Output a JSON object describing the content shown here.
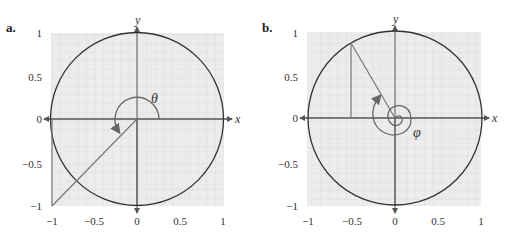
{
  "panels": [
    {
      "label": "a.",
      "axis_x": "x",
      "axis_y": "y",
      "angle_symbol": "θ",
      "x_ticks": [
        "−1",
        "−0.5",
        "0",
        "0.5",
        "1"
      ],
      "y_ticks": [
        "1",
        "0.5",
        "0",
        "−0.5",
        "−1"
      ],
      "point": {
        "x": -1,
        "y": -1
      }
    },
    {
      "label": "b.",
      "axis_x": "x",
      "axis_y": "y",
      "angle_symbol": "φ",
      "x_ticks": [
        "−1",
        "−0.5",
        "0",
        "0.5",
        "1"
      ],
      "y_ticks": [
        "1",
        "0.5",
        "0",
        "−0.5",
        "−1"
      ],
      "point": {
        "x": -0.5,
        "y": 0.866
      }
    }
  ],
  "colors": {
    "grid_bg": "#ececec",
    "grid_line": "#d4d4d4",
    "circle": "#333333",
    "ray": "#777777",
    "axis": "#555555"
  }
}
